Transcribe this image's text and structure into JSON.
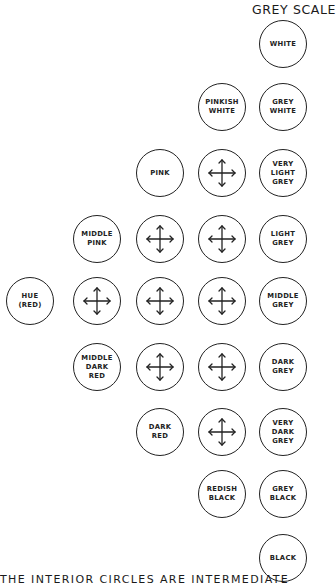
{
  "header": {
    "title": "GREY SCALE"
  },
  "caption": "THE INTERIOR CIRCLES ARE INTERMEDIATE",
  "circles": {
    "white": "WHITE",
    "grey_white": "GREY\nWHITE",
    "very_light_grey": "VERY\nLIGHT\nGREY",
    "light_grey": "LIGHT\nGREY",
    "middle_grey": "MIDDLE\nGREY",
    "dark_grey": "DARK\nGREY",
    "very_dark_grey": "VERY\nDARK\nGREY",
    "grey_black": "GREY\nBLACK",
    "black": "BLACK",
    "pinkish_white": "PINKISH\nWHITE",
    "pink": "PINK",
    "middle_pink": "MIDDLE\nPINK",
    "hue_red": "HUE\n(RED)",
    "middle_dark_red": "MIDDLE\nDARK\nRED",
    "dark_red": "DARK\nRED",
    "redish_black": "REDISH\nBLACK"
  },
  "intermediate_icon": "four-way-arrow-icon"
}
